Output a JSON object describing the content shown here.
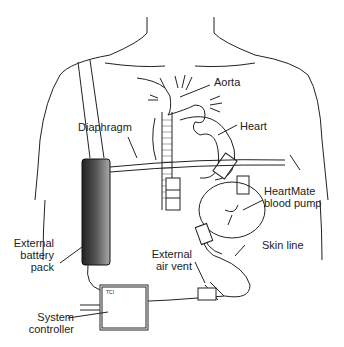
{
  "labels": {
    "aorta": "Aorta",
    "heart": "Heart",
    "diaphragm": "Diaphragm",
    "pump_line1": "HeartMate",
    "pump_line2": "blood pump",
    "skin_line": "Skin line",
    "air_vent_line1": "External",
    "air_vent_line2": "air vent",
    "battery_line1": "External",
    "battery_line2": "battery",
    "battery_line3": "pack",
    "controller_line1": "System",
    "controller_line2": "controller",
    "controller_brand": "TCI"
  },
  "colors": {
    "line": "#222222",
    "battery_dark": "#2a2a2a",
    "battery_light": "#9a9a9a"
  }
}
